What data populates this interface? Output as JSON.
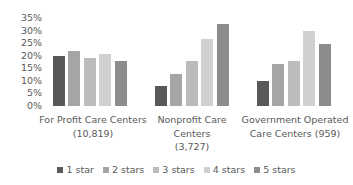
{
  "chart_data": {
    "type": "bar",
    "title": "",
    "xlabel": "",
    "ylabel": "",
    "ylim": [
      0,
      35
    ],
    "yticks": [
      "35%",
      "30%",
      "25%",
      "20%",
      "15%",
      "10%",
      "5%",
      "0%"
    ],
    "grid": false,
    "legend_position": "bottom",
    "categories": [
      "For Profit Care Centers\n(10,819)",
      "Nonprofit Care\nCenters\n(3,727)",
      "Government Operated\nCare Centers (959)"
    ],
    "series": [
      {
        "name": "1 star",
        "color": "#595959",
        "values": [
          19.8,
          7.9,
          9.9
        ]
      },
      {
        "name": "2 stars",
        "color": "#a5a5a5",
        "values": [
          21.7,
          12.6,
          16.7
        ]
      },
      {
        "name": "3 stars",
        "color": "#bcbcbc",
        "values": [
          18.9,
          17.9,
          18.0
        ]
      },
      {
        "name": "4 stars",
        "color": "#d0d0d0",
        "values": [
          20.5,
          26.6,
          29.9
        ]
      },
      {
        "name": "5 stars",
        "color": "#8c8c8c",
        "values": [
          18.0,
          32.7,
          24.7
        ]
      }
    ]
  },
  "layout": {
    "baseline_y": 106,
    "px_per_unit": 2.52,
    "group_starts": [
      53,
      155,
      257
    ],
    "bar_step": 15.4
  }
}
